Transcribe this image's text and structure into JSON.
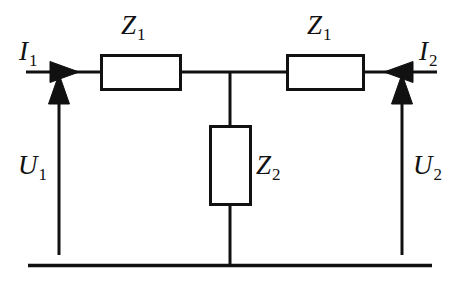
{
  "figure": {
    "background_color": "#ffffff",
    "line_color": "#111111"
  },
  "labels": {
    "z1_left": {
      "symbol": "Z",
      "subscript": "1"
    },
    "z1_right": {
      "symbol": "Z",
      "subscript": "1"
    },
    "z2": {
      "symbol": "Z",
      "subscript": "2"
    },
    "i1": {
      "symbol": "I",
      "subscript": "1"
    },
    "i2": {
      "symbol": "I",
      "subscript": "2"
    },
    "u1": {
      "symbol": "U",
      "subscript": "1"
    },
    "u2": {
      "symbol": "U",
      "subscript": "2"
    }
  },
  "components": [
    {
      "name": "series-resistor-left",
      "type": "impedance-box",
      "label": "Z1",
      "orientation": "horizontal",
      "x": 101,
      "y": 55,
      "width": 79,
      "height": 34
    },
    {
      "name": "series-resistor-right",
      "type": "impedance-box",
      "label": "Z1",
      "orientation": "horizontal",
      "x": 287,
      "y": 55,
      "width": 77,
      "height": 34
    },
    {
      "name": "shunt-resistor",
      "type": "impedance-box",
      "label": "Z2",
      "orientation": "vertical",
      "x": 210,
      "y": 126,
      "width": 40,
      "height": 78
    }
  ],
  "wires": [
    {
      "name": "input-wire",
      "x1": 26,
      "y1": 72,
      "x2": 101,
      "y2": 72
    },
    {
      "name": "mid-left-wire",
      "x1": 180,
      "y1": 72,
      "x2": 287,
      "y2": 72
    },
    {
      "name": "output-wire",
      "x1": 364,
      "y1": 72,
      "x2": 437,
      "y2": 72
    },
    {
      "name": "shunt-top-wire",
      "x1": 230,
      "y1": 72,
      "x2": 230,
      "y2": 126
    },
    {
      "name": "shunt-bottom-wire",
      "x1": 230,
      "y1": 204,
      "x2": 230,
      "y2": 265
    },
    {
      "name": "ground-rail",
      "x1": 28,
      "y1": 265,
      "x2": 432,
      "y2": 265
    }
  ],
  "arrows": [
    {
      "name": "current-i1-arrow",
      "label": "I1",
      "direction": "right",
      "tip_x": 78,
      "tip_y": 72
    },
    {
      "name": "current-i2-arrow",
      "label": "I2",
      "direction": "left",
      "tip_x": 385,
      "tip_y": 72
    },
    {
      "name": "voltage-u1-arrow",
      "label": "U1",
      "direction": "up",
      "x": 59,
      "y1": 255,
      "y2": 78
    },
    {
      "name": "voltage-u2-arrow",
      "label": "U2",
      "direction": "up",
      "x": 402,
      "y1": 255,
      "y2": 78
    }
  ]
}
